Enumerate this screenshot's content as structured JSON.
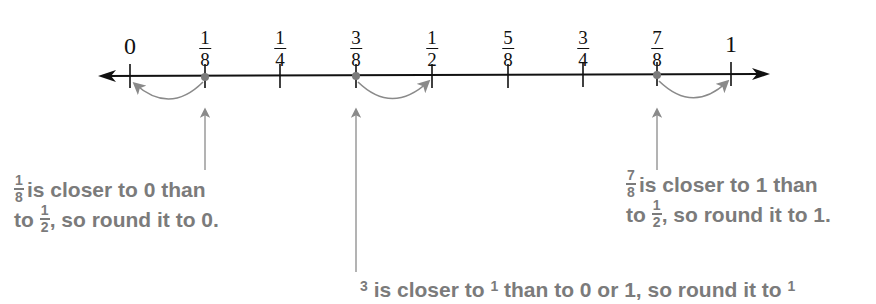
{
  "diagram": {
    "colors": {
      "axis": "#111111",
      "annotation": "#7b7b7b",
      "arrow": "#8a8a8a",
      "point": "#7b7b7b"
    },
    "number_line": {
      "labels": [
        {
          "type": "whole",
          "text": "0",
          "x": 130
        },
        {
          "type": "frac",
          "num": "1",
          "den": "8",
          "x": 205
        },
        {
          "type": "frac",
          "num": "1",
          "den": "4",
          "x": 280
        },
        {
          "type": "frac",
          "num": "3",
          "den": "8",
          "x": 356
        },
        {
          "type": "frac",
          "num": "1",
          "den": "2",
          "x": 432
        },
        {
          "type": "frac",
          "num": "5",
          "den": "8",
          "x": 508
        },
        {
          "type": "frac",
          "num": "3",
          "den": "4",
          "x": 583
        },
        {
          "type": "frac",
          "num": "7",
          "den": "8",
          "x": 656
        },
        {
          "type": "whole",
          "text": "1",
          "x": 731
        }
      ],
      "highlighted_points": [
        "1/8",
        "3/8",
        "7/8"
      ]
    },
    "annotations": {
      "left": {
        "frac_num": "1",
        "frac_den": "8",
        "line1_rest": "is closer to 0 than",
        "line2_pre": "to",
        "frac2_num": "1",
        "frac2_den": "2",
        "line2_rest": ", so round it to 0."
      },
      "right": {
        "frac_num": "7",
        "frac_den": "8",
        "line1_rest": "is closer to 1 than",
        "line2_pre": "to",
        "frac2_num": "1",
        "frac2_den": "2",
        "line2_rest": ", so round it to 1."
      },
      "bottom": {
        "frac_num": "3",
        "text_a": "is closer to",
        "frac2_num": "1",
        "text_b": "than to 0 or 1, so round it to",
        "frac3_num": "1"
      }
    }
  }
}
